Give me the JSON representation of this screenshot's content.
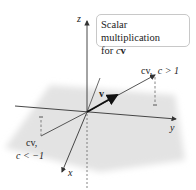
{
  "figure": {
    "caption_line1": "Scalar multiplication",
    "caption_line2_prefix": "for ",
    "caption_c": "c",
    "caption_v": "v",
    "axes": {
      "x": "x",
      "y": "y",
      "z": "z"
    },
    "vectors": {
      "v_label": "v",
      "cv_pos_label_cv": "cv,",
      "cv_pos_label_cond": "c > 1",
      "cv_neg_label_cv": "cv,",
      "cv_neg_label_cond": "c < −1"
    },
    "colors": {
      "plane": "#e3e3e3",
      "axis": "#333333",
      "vector": "#555555",
      "v_vector": "#111111"
    }
  }
}
